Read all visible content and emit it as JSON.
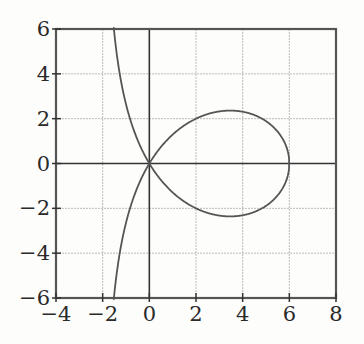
{
  "chart_data": {
    "type": "line",
    "title": "",
    "xlabel": "",
    "ylabel": "",
    "xlim": [
      -4,
      8
    ],
    "ylim": [
      -6,
      6
    ],
    "grid": true,
    "x_ticks": [
      -4,
      -2,
      0,
      2,
      4,
      6,
      8
    ],
    "y_ticks": [
      -6,
      -4,
      -2,
      0,
      2,
      4,
      6
    ],
    "x_tick_labels": [
      "−4",
      "−2",
      "0",
      "2",
      "4",
      "6",
      "8"
    ],
    "y_tick_labels": [
      "−6",
      "−4",
      "−2",
      "0",
      "2",
      "4",
      "6"
    ],
    "equation": "y^2 = x^2 (6 - x) / (2 + x)",
    "series": [
      {
        "name": "strophoid",
        "description": "Curve with a loop from (0,0) to (6,0) and branches approaching the asymptote x = -2",
        "points_upper": [
          [
            -1.5,
            5.81
          ],
          [
            -1.0,
            2.65
          ],
          [
            -0.5,
            0.81
          ],
          [
            0,
            0
          ],
          [
            1,
            1.29
          ],
          [
            2,
            2.0
          ],
          [
            3,
            2.32
          ],
          [
            3.5,
            2.36
          ],
          [
            4,
            2.31
          ],
          [
            5,
            1.89
          ],
          [
            5.5,
            1.32
          ],
          [
            6,
            0
          ]
        ],
        "points_lower": [
          [
            -1.5,
            -5.81
          ],
          [
            -1.0,
            -2.65
          ],
          [
            -0.5,
            -0.81
          ],
          [
            0,
            0
          ],
          [
            1,
            -1.29
          ],
          [
            2,
            -2.0
          ],
          [
            3,
            -2.32
          ],
          [
            3.5,
            -2.36
          ],
          [
            4,
            -2.31
          ],
          [
            5,
            -1.89
          ],
          [
            5.5,
            -1.32
          ],
          [
            6,
            0
          ]
        ]
      }
    ],
    "annotations": [],
    "legend": null
  },
  "colors": {
    "curve": "#555555",
    "axes": "#333333",
    "frame": "#555555",
    "grid": "#bbbbbb",
    "background": "#fdfdfc"
  }
}
